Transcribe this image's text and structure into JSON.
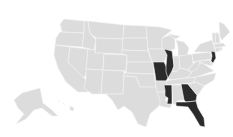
{
  "map": {
    "title": "United States map",
    "colors": {
      "background": "#ffffff",
      "default_fill": "#dcdcdc",
      "highlight_fill": "#2b2b2b",
      "border": "#f4f4f4"
    },
    "highlighted_states": [
      "Missouri",
      "Illinois",
      "Mississippi",
      "Georgia",
      "Florida",
      "New Jersey"
    ],
    "states": [
      {
        "id": "WA",
        "name": "Washington",
        "d": "M64,19 L84,21 L84,33 L62,32 L60,24 Z"
      },
      {
        "id": "OR",
        "name": "Oregon",
        "d": "M60,32 L84,33 L82,47 L55,45 L56,38 Z"
      },
      {
        "id": "CA",
        "name": "California",
        "d": "M55,45 L70,47 L68,62 L90,84 L88,92 L78,92 L66,82 L58,68 L54,55 Z"
      },
      {
        "id": "ID",
        "name": "Idaho",
        "d": "M84,21 L88,21 L90,33 L96,40 L94,50 L82,47 L84,33 Z"
      },
      {
        "id": "NV",
        "name": "Nevada",
        "d": "M70,47 L88,49 L86,74 L84,78 L68,62 Z"
      },
      {
        "id": "MT",
        "name": "Montana",
        "d": "M88,21 L124,25 L123,39 L96,38 L90,33 Z"
      },
      {
        "id": "WY",
        "name": "Wyoming",
        "d": "M96,38 L123,39 L122,54 L95,53 Z"
      },
      {
        "id": "UT",
        "name": "Utah",
        "d": "M88,49 L95,50 L95,53 L104,53 L103,70 L86,69 Z"
      },
      {
        "id": "AZ",
        "name": "Arizona",
        "d": "M86,69 L103,70 L101,94 L92,94 L84,88 L86,78 Z"
      },
      {
        "id": "CO",
        "name": "Colorado",
        "d": "M104,54 L127,55 L126,71 L103,70 Z"
      },
      {
        "id": "NM",
        "name": "New Mexico",
        "d": "M103,70 L124,71 L123,94 L106,94 L101,94 Z"
      },
      {
        "id": "ND",
        "name": "North Dakota",
        "d": "M124,25 L146,26 L147,38 L123,38 Z"
      },
      {
        "id": "SD",
        "name": "South Dakota",
        "d": "M123,38 L147,38 L148,51 L122,50 Z"
      },
      {
        "id": "NE",
        "name": "Nebraska",
        "d": "M122,50 L148,51 L152,62 L127,62 L127,55 L122,54 Z"
      },
      {
        "id": "KS",
        "name": "Kansas",
        "d": "M127,62 L153,62 L154,74 L126,73 Z"
      },
      {
        "id": "OK",
        "name": "Oklahoma",
        "d": "M124,73 L154,74 L156,87 L140,87 L136,77 L124,76 Z"
      },
      {
        "id": "TX",
        "name": "Texas",
        "d": "M124,76 L136,77 L140,87 L156,87 L162,92 L160,105 L150,114 L146,127 L138,124 L132,112 L124,106 L118,110 L112,100 L106,94 L123,94 Z"
      },
      {
        "id": "MN",
        "name": "Minnesota",
        "d": "M146,26 L160,27 L172,30 L162,38 L162,49 L148,49 L147,38 Z"
      },
      {
        "id": "IA",
        "name": "Iowa",
        "d": "M148,49 L164,49 L167,55 L164,62 L152,62 Z"
      },
      {
        "id": "MO",
        "name": "Missouri",
        "d": "M152,62 L164,62 L166,66 L169,76 L166,81 L156,81 L155,74 L153,62 Z"
      },
      {
        "id": "AR",
        "name": "Arkansas",
        "d": "M155,81 L167,81 L166,92 L157,92 L156,87 Z"
      },
      {
        "id": "LA",
        "name": "Louisiana",
        "d": "M157,92 L166,92 L167,97 L165,100 L172,104 L170,108 L160,106 L160,100 Z"
      },
      {
        "id": "WI",
        "name": "Wisconsin",
        "d": "M162,38 L172,34 L175,40 L175,49 L167,51 L164,49 L162,49 Z"
      },
      {
        "id": "IL",
        "name": "Illinois",
        "d": "M164,49 L172,51 L173,58 L174,66 L171,75 L168,78 L166,72 L166,66 L167,55 Z"
      },
      {
        "id": "MI",
        "name": "Michigan",
        "d": "M176,40 L184,42 L189,48 L187,56 L178,56 L178,47 Z M168,34 L180,36 L176,39 Z"
      },
      {
        "id": "IN",
        "name": "Indiana",
        "d": "M173,56 L179,56 L180,68 L176,72 L172,71 L174,66 Z"
      },
      {
        "id": "OH",
        "name": "Ohio",
        "d": "M179,56 L192,54 L193,64 L188,70 L180,68 Z"
      },
      {
        "id": "KY",
        "name": "Kentucky",
        "d": "M168,78 L172,71 L176,72 L180,68 L188,70 L192,73 L186,78 L170,80 Z"
      },
      {
        "id": "TN",
        "name": "Tennessee",
        "d": "M167,81 L170,80 L186,78 L196,77 L193,83 L166,85 Z"
      },
      {
        "id": "MS",
        "name": "Mississippi",
        "d": "M164,85 L172,85 L172,104 L167,104 L168,98 L165,96 L165,90 Z"
      },
      {
        "id": "AL",
        "name": "Alabama",
        "d": "M172,85 L181,85 L184,100 L177,101 L177,105 L173,104 Z"
      },
      {
        "id": "GA",
        "name": "Georgia",
        "d": "M181,84 L188,84 L197,95 L196,101 L186,102 L184,100 Z"
      },
      {
        "id": "FL",
        "name": "Florida",
        "d": "M176,102 L186,102 L196,101 L198,108 L204,118 L205,127 L200,126 L193,114 L188,107 L176,106 Z"
      },
      {
        "id": "SC",
        "name": "South Carolina",
        "d": "M188,84 L196,82 L204,86 L198,95 L197,95 Z"
      },
      {
        "id": "NC",
        "name": "North Carolina",
        "d": "M193,83 L196,77 L216,73 L214,80 L204,86 L196,82 Z"
      },
      {
        "id": "VA",
        "name": "Virginia",
        "d": "M188,70 L193,64 L198,62 L204,64 L214,71 L196,77 L186,78 L192,73 Z"
      },
      {
        "id": "WV",
        "name": "West Virginia",
        "d": "M193,64 L198,60 L200,62 L198,68 L192,72 L188,70 Z"
      },
      {
        "id": "PA",
        "name": "Pennsylvania",
        "d": "M192,54 L210,52 L212,59 L198,61 L193,62 Z"
      },
      {
        "id": "NY",
        "name": "New York",
        "d": "M194,52 L200,44 L212,40 L216,52 L212,55 L210,52 Z"
      },
      {
        "id": "MD",
        "name": "Maryland",
        "d": "M198,61 L210,60 L212,66 L204,64 L200,62 Z"
      },
      {
        "id": "DE",
        "name": "Delaware",
        "d": "M210,60 L213,60 L213,65 L211,65 Z"
      },
      {
        "id": "NJ",
        "name": "New Jersey",
        "d": "M211,51 L215,52 L216,58 L213,63 L211,61 L212,56 Z"
      },
      {
        "id": "CT",
        "name": "Connecticut",
        "d": "M215,48 L220,47 L220,51 L216,52 Z"
      },
      {
        "id": "RI",
        "name": "Rhode Island",
        "d": "M220,47 L222,47 L222,50 L220,51 Z"
      },
      {
        "id": "MA",
        "name": "Massachusetts",
        "d": "M214,44 L223,43 L226,46 L220,47 L215,48 Z"
      },
      {
        "id": "VT",
        "name": "Vermont",
        "d": "M212,33 L216,33 L215,43 L213,44 Z"
      },
      {
        "id": "NH",
        "name": "New Hampshire",
        "d": "M216,32 L219,34 L220,43 L215,43 Z"
      },
      {
        "id": "ME",
        "name": "Maine",
        "d": "M219,22 L224,24 L230,32 L222,40 L220,37 Z"
      },
      {
        "id": "AK",
        "name": "Alaska",
        "d": "M22,93 L40,88 L43,103 L52,110 L58,116 L52,116 L42,108 L34,110 L26,119 L16,124 L24,114 L18,108 L14,100 Z"
      },
      {
        "id": "HI",
        "name": "Hawaii",
        "d": "M70,106 L74,108 L73,111 L70,110 Z M63,103 L65,104 L64,105 Z M58,101 L60,101 L59,102 Z"
      }
    ]
  }
}
